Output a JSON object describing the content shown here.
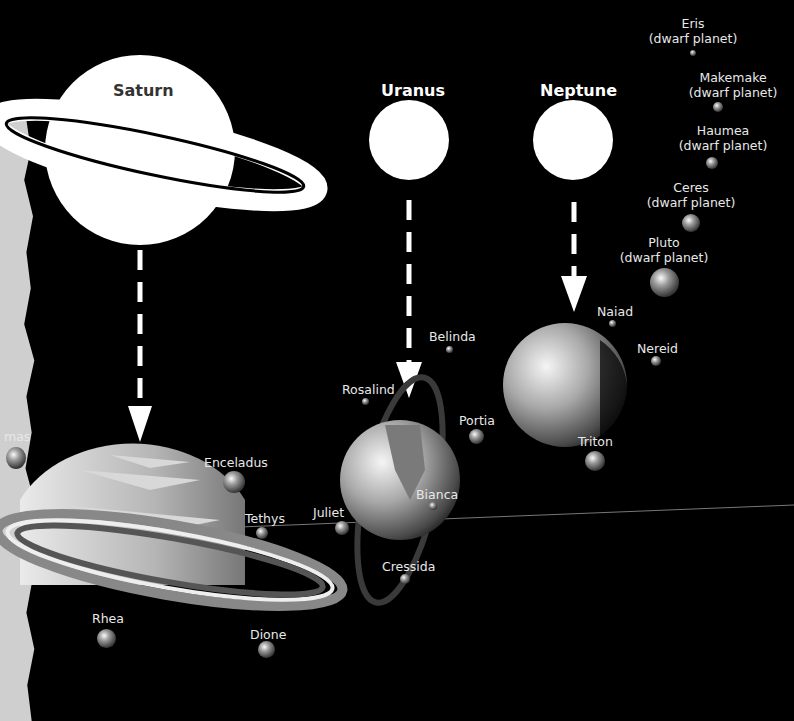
{
  "diagram": {
    "planets": [
      {
        "name": "Saturn",
        "icon": "saturn-icon"
      },
      {
        "name": "Uranus",
        "icon": "uranus-icon"
      },
      {
        "name": "Neptune",
        "icon": "neptune-icon"
      }
    ],
    "saturn_moons": {
      "partial": "mas",
      "enceladus": "Enceladus",
      "tethys": "Tethys",
      "rhea": "Rhea",
      "dione": "Dione"
    },
    "uranus_moons": {
      "belinda": "Belinda",
      "rosalind": "Rosalind",
      "portia": "Portia",
      "juliet": "Juliet",
      "bianca": "Bianca",
      "cressida": "Cressida"
    },
    "neptune_moons": {
      "naiad": "Naiad",
      "nereid": "Nereid",
      "triton": "Triton"
    },
    "dwarf_planets": [
      {
        "name": "Eris",
        "type": "(dwarf planet)"
      },
      {
        "name": "Makemake",
        "type": "(dwarf planet)"
      },
      {
        "name": "Haumea",
        "type": "(dwarf planet)"
      },
      {
        "name": "Ceres",
        "type": "(dwarf planet)"
      },
      {
        "name": "Pluto",
        "type": "(dwarf planet)"
      }
    ],
    "colors": {
      "background": "#000000",
      "outline": "#ffffff",
      "label": "#e8e8e8"
    }
  }
}
